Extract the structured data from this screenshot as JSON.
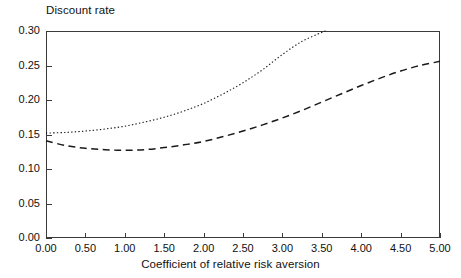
{
  "chart_data": {
    "type": "line",
    "title": "",
    "ylabel": "Discount rate",
    "xlabel": "Coefficient of relative risk aversion",
    "xlim": [
      0.0,
      5.0
    ],
    "ylim": [
      0.0,
      0.3
    ],
    "xticks": [
      "0.00",
      "0.50",
      "1.00",
      "1.50",
      "2.00",
      "2.50",
      "3.00",
      "3.50",
      "4.00",
      "4.50",
      "5.00"
    ],
    "xtick_values": [
      0.0,
      0.5,
      1.0,
      1.5,
      2.0,
      2.5,
      3.0,
      3.5,
      4.0,
      4.5,
      5.0
    ],
    "yticks": [
      "0.00",
      "0.05",
      "0.10",
      "0.15",
      "0.20",
      "0.25",
      "0.30"
    ],
    "ytick_values": [
      0.0,
      0.05,
      0.1,
      0.15,
      0.2,
      0.25,
      0.3
    ],
    "grid": false,
    "legend": "none",
    "series": [
      {
        "name": "dotted-curve",
        "style": "dotted",
        "color": "#1a1a1a",
        "x": [
          0.0,
          0.25,
          0.5,
          0.75,
          1.0,
          1.25,
          1.5,
          1.75,
          2.0,
          2.25,
          2.5,
          2.75,
          3.0,
          3.25,
          3.5,
          3.55
        ],
        "values": [
          0.152,
          0.153,
          0.155,
          0.158,
          0.162,
          0.168,
          0.175,
          0.184,
          0.195,
          0.209,
          0.225,
          0.244,
          0.266,
          0.285,
          0.298,
          0.3
        ]
      },
      {
        "name": "dashed-curve",
        "style": "dashed",
        "color": "#1a1a1a",
        "x": [
          0.0,
          0.25,
          0.5,
          0.75,
          1.0,
          1.25,
          1.5,
          1.75,
          2.0,
          2.25,
          2.5,
          2.75,
          3.0,
          3.25,
          3.5,
          3.75,
          4.0,
          4.25,
          4.5,
          4.75,
          5.0
        ],
        "values": [
          0.141,
          0.134,
          0.13,
          0.128,
          0.127,
          0.128,
          0.131,
          0.135,
          0.14,
          0.147,
          0.155,
          0.164,
          0.174,
          0.185,
          0.197,
          0.209,
          0.221,
          0.232,
          0.242,
          0.25,
          0.256
        ]
      }
    ]
  },
  "axes": {
    "plot_left_px": 46,
    "plot_right_px": 440,
    "plot_top_px": 31,
    "plot_bottom_px": 238,
    "frame_color": "#3a3a3a"
  }
}
